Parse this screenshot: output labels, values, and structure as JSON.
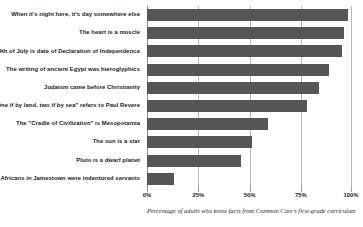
{
  "chart_data": {
    "type": "bar",
    "orientation": "horizontal",
    "title": "",
    "subtitle": "",
    "xlabel": "Percentage of adults who know facts from Common Core's first-grade curriculum",
    "ylabel": "",
    "xlim": [
      0,
      100
    ],
    "grid": true,
    "legend": null,
    "bar_color": "#565656",
    "gridline_color": "#b9b9b9",
    "axis_color": "#8f8f8f",
    "xticks": [
      0,
      25,
      50,
      75,
      100
    ],
    "xtick_labels": [
      "0%",
      "25%",
      "50%",
      "75%",
      "100%"
    ],
    "categories": [
      "When it's night here, it's day somewhere else",
      "The heart is a muscle",
      "4th of July is date of Declaration of Independence",
      "The writing of ancient Egypt was hieroglyphics",
      "Judaism came before Christianity",
      "\"One if by land, two if by sea\" refers to Paul Revere",
      "The \"Cradle of Civilization\" is Mesopotamia",
      "The sun is a star",
      "Pluto is a dwarf planet",
      "Africans in Jamestown were indentured servants"
    ],
    "values": [
      98,
      96,
      95,
      89,
      84,
      78,
      59,
      51,
      46,
      13
    ]
  }
}
